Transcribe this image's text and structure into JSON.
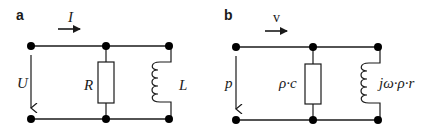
{
  "figure": {
    "panels": [
      {
        "id": "a",
        "letter": "a",
        "current_label": "I",
        "voltage_label": "U",
        "resistor_label": "R",
        "inductor_label": "L"
      },
      {
        "id": "b",
        "letter": "b",
        "current_label": "v",
        "voltage_label": "p",
        "resistor_label": "ρ·c",
        "inductor_label": "jω·ρ·r"
      }
    ],
    "colors": {
      "stroke": "#1a1a1a",
      "node": "#000000",
      "background": "#ffffff"
    }
  }
}
